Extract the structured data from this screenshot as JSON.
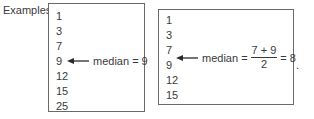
{
  "label": "Examples:",
  "example1": {
    "values": [
      "1",
      "3",
      "7",
      "9",
      "12",
      "15",
      "25"
    ],
    "annotation": "median = 9"
  },
  "example2": {
    "values": [
      "1",
      "3",
      "7",
      "9",
      "12",
      "15"
    ],
    "annotation_prefix": "median =",
    "numerator": "7 + 9",
    "denominator": "2",
    "result": "= 8"
  },
  "trailing": "."
}
